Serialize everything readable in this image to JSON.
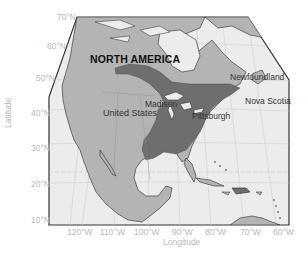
{
  "map": {
    "title": "NORTH AMERICA",
    "place_labels": {
      "united_states": "United States",
      "madison": "Madison",
      "pittsburgh": "Pittsburgh",
      "newfoundland": "Newfoundland",
      "nova_scotia": "Nova Scotia"
    },
    "axes": {
      "xlabel": "Longitude",
      "ylabel": "Latitude",
      "lat_ticks": [
        "70°N",
        "60°N",
        "50°N",
        "40°N",
        "30°N",
        "20°N",
        "10°N"
      ],
      "lon_ticks": [
        "120°W",
        "110°W",
        "100°W",
        "90°W",
        "80°W",
        "70°W",
        "60°W"
      ]
    },
    "colors": {
      "ocean": "#ececec",
      "land": "#b4b4b4",
      "highlight_region": "#6e6e6e",
      "coast": "#2a2a2a",
      "graticule": "#cfcfcf",
      "frame": "#333333"
    }
  }
}
